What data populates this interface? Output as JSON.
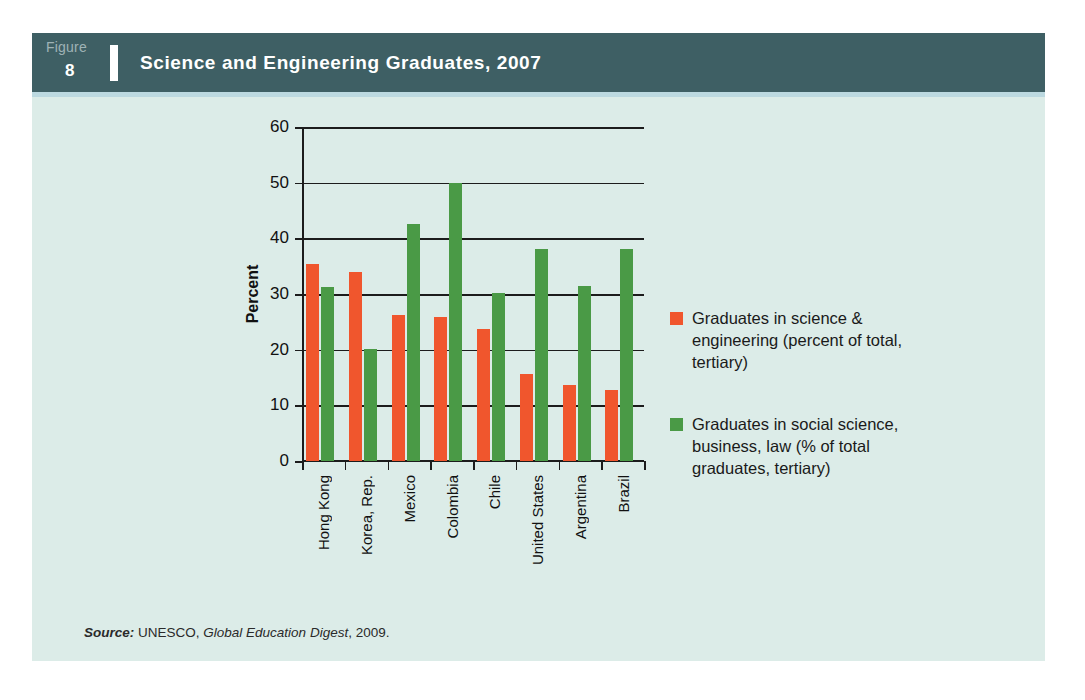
{
  "figure": {
    "label_word": "Figure",
    "number": "8",
    "title": "Science and Engineering Graduates, 2007",
    "header_color": "#3e5f64",
    "panel_color": "#dcece8"
  },
  "source": {
    "prefix": "Source:",
    "publisher": "UNESCO,",
    "publication": "Global Education Digest",
    "year": ", 2009."
  },
  "legend": {
    "position": "right",
    "entries": [
      {
        "color": "#f0562d",
        "label": "Graduates in science & engineering (percent of total, tertiary)"
      },
      {
        "color": "#4a9a46",
        "label": "Graduates in social science, business, law (% of total graduates, tertiary)"
      }
    ]
  },
  "chart_data": {
    "type": "bar",
    "title": "Science and Engineering Graduates, 2007",
    "xlabel": "",
    "ylabel": "Percent",
    "ylim": [
      0,
      60
    ],
    "yticks": [
      0,
      10,
      20,
      30,
      40,
      50,
      60
    ],
    "grid": true,
    "categories": [
      "Hong Kong",
      "Korea, Rep.",
      "Mexico",
      "Colombia",
      "Chile",
      "United States",
      "Argentina",
      "Brazil"
    ],
    "series": [
      {
        "name": "Graduates in science & engineering (percent of total, tertiary)",
        "color": "#f0562d",
        "values": [
          35.4,
          34.0,
          26.3,
          25.8,
          23.8,
          15.7,
          13.6,
          12.7
        ]
      },
      {
        "name": "Graduates in social science, business, law (% of total graduates, tertiary)",
        "color": "#4a9a46",
        "values": [
          31.2,
          20.1,
          42.5,
          50.0,
          30.1,
          38.0,
          31.5,
          38.0
        ]
      }
    ]
  }
}
